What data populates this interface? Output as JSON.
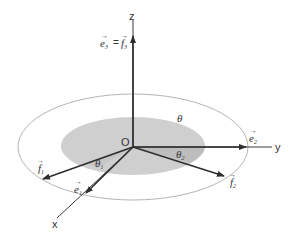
{
  "diagram": {
    "origin_label": "O",
    "axes": {
      "x": "x",
      "y": "y",
      "z": "z"
    },
    "vectors": {
      "e1": {
        "base": "e",
        "sub": "1"
      },
      "e2": {
        "base": "e",
        "sub": "2"
      },
      "e3_eq_f3": {
        "left_base": "e",
        "left_sub": "3",
        "eq": "=",
        "right_base": "f",
        "right_sub": "3"
      },
      "f1": {
        "base": "f",
        "sub": "1"
      },
      "f2": {
        "base": "f",
        "sub": "2"
      }
    },
    "angles": {
      "theta": "θ",
      "theta1": {
        "base": "θ",
        "sub": "1"
      },
      "theta2": {
        "base": "θ",
        "sub": "2"
      }
    },
    "colors": {
      "axis": "#3a3a3a",
      "vector": "#2e2e2e",
      "outer_ellipse": "#b5b5b5",
      "inner_disk": "#cfcfcf",
      "inner_disk_dark": "#bdbdbd"
    }
  }
}
